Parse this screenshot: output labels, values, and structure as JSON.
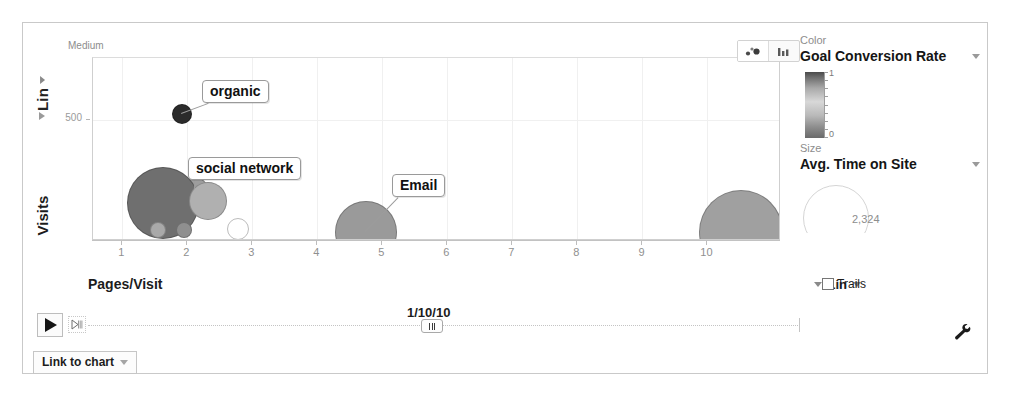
{
  "widget": {
    "series_label": "Medium",
    "y_scale": "Lin",
    "y_axis_title": "Visits",
    "x_axis_title": "Pages/Visit",
    "x_scale": "Lin",
    "trails_label": "Trails",
    "timeline_date": "1/10/10",
    "link_to_chart_label": "Link to chart"
  },
  "panel": {
    "color_caption": "Color",
    "color_metric": "Goal Conversion Rate",
    "color_max": "1",
    "color_min": "0",
    "size_caption": "Size",
    "size_metric": "Avg. Time on Site",
    "size_value": "2,324"
  },
  "chart_data": {
    "type": "scatter",
    "title": "",
    "xlabel": "Pages/Visit",
    "ylabel": "Visits",
    "xlim": [
      0.55,
      11.1
    ],
    "ylim": [
      0,
      760
    ],
    "xticks": [
      1,
      2,
      3,
      4,
      5,
      6,
      7,
      8,
      9,
      10
    ],
    "yticks": [
      500
    ],
    "grid": true,
    "legend": "none",
    "size_metric": "Avg. Time on Site",
    "color_metric": "Goal Conversion Rate",
    "points": [
      {
        "label": "organic",
        "x": 1.92,
        "y": 525,
        "size": 10,
        "color": "#2b2b2b",
        "annotated": true
      },
      {
        "label": "social network",
        "x": 2.12,
        "y": 205,
        "size": 13,
        "color": "#9d9d9d",
        "annotated": true
      },
      {
        "label": "",
        "x": 1.62,
        "y": 150,
        "size": 36,
        "color": "#6f6f6f",
        "annotated": false
      },
      {
        "label": "",
        "x": 2.32,
        "y": 160,
        "size": 19,
        "color": "#b0b0b0",
        "annotated": false
      },
      {
        "label": "",
        "x": 1.55,
        "y": 38,
        "size": 8,
        "color": "#a9a9a9",
        "annotated": false
      },
      {
        "label": "",
        "x": 1.95,
        "y": 38,
        "size": 8,
        "color": "#8f8f8f",
        "annotated": false
      },
      {
        "label": "",
        "x": 2.78,
        "y": 40,
        "size": 11,
        "color": "#ffffff",
        "annotated": false
      },
      {
        "label": "Email",
        "x": 4.75,
        "y": 30,
        "size": 31,
        "color": "#9a9a9a",
        "annotated": true
      },
      {
        "label": "",
        "x": 10.52,
        "y": 28,
        "size": 42,
        "color": "#a0a0a0",
        "annotated": false
      }
    ],
    "annotations": [
      {
        "text": "organic",
        "anchor_x": 1.92,
        "anchor_y": 525
      },
      {
        "text": "social network",
        "anchor_x": 2.12,
        "anchor_y": 205
      },
      {
        "text": "Email",
        "anchor_x": 4.75,
        "anchor_y": 30
      }
    ]
  }
}
